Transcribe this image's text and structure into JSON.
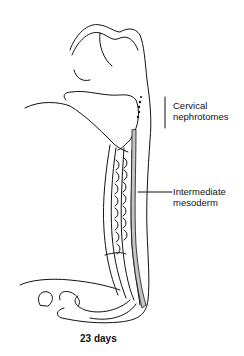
{
  "figure": {
    "labels": {
      "cervical": [
        "Cervical",
        "nephrotomes"
      ],
      "intermediate": [
        "Intermediate",
        "mesoderm"
      ]
    },
    "caption": "23 days",
    "colors": {
      "line": "#111111",
      "shade": "#c4c4c4",
      "background": "#ffffff"
    }
  }
}
